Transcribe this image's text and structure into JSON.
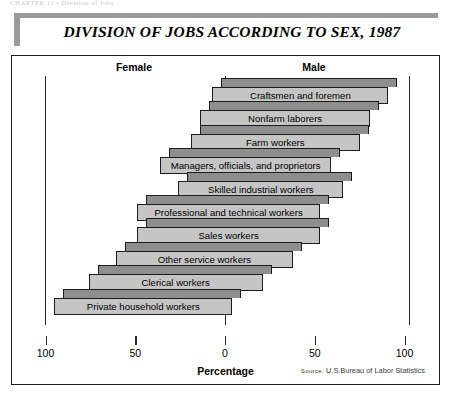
{
  "running_head": "CHAPTER 11 • Division of Jobs",
  "title": "DIVISION OF JOBS ACCORDING TO SEX, 1987",
  "headers": {
    "female": "Female",
    "male": "Male"
  },
  "axis": {
    "xlabel": "Percentage",
    "ticks": [
      "100",
      "50",
      "0",
      "50",
      "100"
    ]
  },
  "source": {
    "prefix": "Source:",
    "text": "U.S.Bureau of Labor Statistics"
  },
  "colors": {
    "bar_front": "#c5c5c5",
    "bar_top": "#8e8e8e",
    "outline": "#1c1c1c",
    "rule": "#9a9a9a"
  },
  "chart_data": {
    "type": "bar",
    "title": "DIVISION OF JOBS ACCORDING TO SEX, 1987",
    "subtype": "diverging-horizontal-bar",
    "xlabel": "Percentage",
    "ylabel": "",
    "xlim": [
      -100,
      100
    ],
    "xticks": [
      100,
      50,
      0,
      50,
      100
    ],
    "grid": false,
    "legend": [
      "Female",
      "Male"
    ],
    "legend_position": "top",
    "categories": [
      "Craftsmen and foremen",
      "Nonfarm laborers",
      "Farm workers",
      "Managers, officials, and proprietors",
      "Skilled industrial workers",
      "Professional and technical workers",
      "Sales workers",
      "Other service workers",
      "Clerical workers",
      "Private household workers"
    ],
    "series": [
      {
        "name": "Female",
        "values": [
          7,
          14,
          19,
          36,
          26,
          49,
          49,
          61,
          76,
          95
        ]
      },
      {
        "name": "Male",
        "values": [
          91,
          81,
          75,
          59,
          66,
          53,
          53,
          38,
          21,
          4
        ]
      }
    ]
  }
}
